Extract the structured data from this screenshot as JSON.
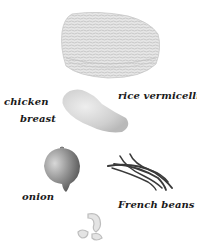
{
  "figure": {
    "background": "#ffffff",
    "items": [
      {
        "id": "rice-vermicelli",
        "label": "rice vermicelli"
      },
      {
        "id": "chicken-breast",
        "label_line1": "chicken",
        "label_line2": "breast"
      },
      {
        "id": "onion",
        "label": "onion"
      },
      {
        "id": "french-beans",
        "label": "French beans"
      },
      {
        "id": "prawns",
        "label": ""
      }
    ]
  },
  "labels": {
    "rice_vermicelli": "rice vermicelli",
    "chicken_line1": "chicken",
    "chicken_line2": "breast",
    "onion": "onion",
    "french_beans": "French beans"
  },
  "colors": {
    "text": "#1a1a1a",
    "vermicelli": "#d8d8d8",
    "chicken": "#d4d4d4",
    "onion": "#8a8a8a",
    "beans": "#3a3a3a",
    "prawn": "#c8c8c8"
  }
}
